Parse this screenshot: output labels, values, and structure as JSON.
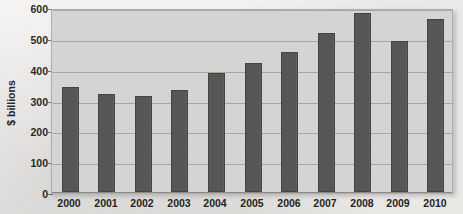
{
  "chart_data": {
    "type": "bar",
    "title": "",
    "subtitle": "",
    "xlabel": "",
    "ylabel": "$ billions",
    "categories": [
      "2000",
      "2001",
      "2002",
      "2003",
      "2004",
      "2005",
      "2006",
      "2007",
      "2008",
      "2009",
      "2010"
    ],
    "values": [
      340,
      318,
      312,
      330,
      385,
      418,
      455,
      515,
      582,
      490,
      562
    ],
    "series": [
      {
        "name": "$ billions",
        "values": [
          340,
          318,
          312,
          330,
          385,
          418,
          455,
          515,
          582,
          490,
          562
        ]
      }
    ],
    "ylim": [
      0,
      600
    ],
    "y_ticks": [
      0,
      100,
      200,
      300,
      400,
      500,
      600
    ],
    "y_tick_labels": [
      "0",
      "100",
      "200",
      "300",
      "400",
      "500",
      "600"
    ],
    "grid": true,
    "grid_axis": "y",
    "legend": false,
    "legend_position": "none",
    "data_labels": false,
    "bar_color": "#585755",
    "bar_border_color": "#46453f",
    "plot_background": "#d6d5d3",
    "gridline_color": "#a9a8a5",
    "page_background": "#efeeec",
    "text_color": "#25241f"
  }
}
